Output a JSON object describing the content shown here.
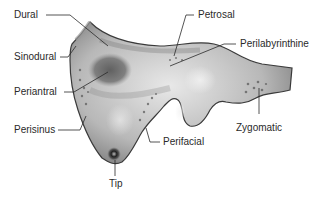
{
  "diagram": {
    "labels": [
      {
        "id": "dural",
        "text": "Dural"
      },
      {
        "id": "sinodural",
        "text": "Sinodural"
      },
      {
        "id": "periantral",
        "text": "Periantral"
      },
      {
        "id": "perisinus",
        "text": "Perisinus"
      },
      {
        "id": "tip",
        "text": "Tip"
      },
      {
        "id": "perifacial",
        "text": "Perifacial"
      },
      {
        "id": "petrosal",
        "text": "Petrosal"
      },
      {
        "id": "perilabyrinthine",
        "text": "Perilabyrinthine"
      },
      {
        "id": "zygomatic",
        "text": "Zygomatic"
      }
    ],
    "colors": {
      "bone_light": "#e6e6e6",
      "bone_mid": "#a8a8a8",
      "bone_dark": "#4a4a4a",
      "outline": "#3a3a3a",
      "leader": "#2a2a2a",
      "text": "#2a2a2a"
    }
  }
}
